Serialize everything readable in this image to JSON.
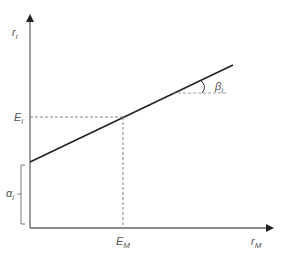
{
  "diagram": {
    "y_axis_label": {
      "main": "r",
      "sub": "i"
    },
    "x_axis_label": {
      "main": "r",
      "sub": "M"
    },
    "expected_return_asset": {
      "main": "E",
      "sub": "i"
    },
    "expected_return_market": {
      "main": "E",
      "sub": "M"
    },
    "intercept_label": {
      "main": "α",
      "sub": "i"
    },
    "slope_label": {
      "main": "β",
      "sub": "i"
    },
    "colors": {
      "axis": "#555555",
      "line": "#222222",
      "dashed": "#777777",
      "text": "#555555"
    }
  }
}
